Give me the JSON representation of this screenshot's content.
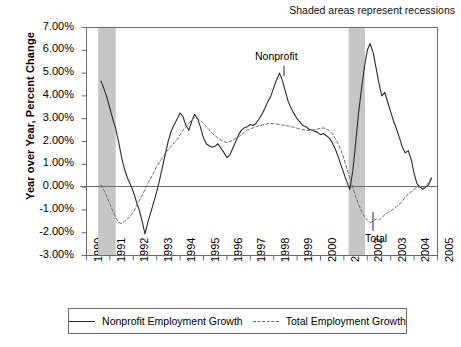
{
  "subtitle": "Shaded areas represent recessions",
  "axis": {
    "ylabel": "Year over Year, Percent Change",
    "yticks": [
      "7.00%",
      "6.00%",
      "5.00%",
      "4.00%",
      "3.00%",
      "2.00%",
      "1.00%",
      "0.00%",
      "-1.00%",
      "-2.00%",
      "-3.00%"
    ],
    "xticks": [
      "1990",
      "1991",
      "1992",
      "1993",
      "1994",
      "1995",
      "1996",
      "1997",
      "1998",
      "1999",
      "2000",
      "2001",
      "2002",
      "2003",
      "2004",
      "2005"
    ]
  },
  "annotations": {
    "nonprofit": "Nonprofit",
    "total": "Total"
  },
  "legend": {
    "items": [
      {
        "label": "Nonprofit Employment Growth",
        "style": "solid",
        "color": "#2b2b2b"
      },
      {
        "label": "Total Employment Growth",
        "style": "dashed",
        "color": "#6e6e6e"
      }
    ]
  },
  "colors": {
    "nonprofit_line": "#2b2b2b",
    "total_line": "#6e6e6e",
    "recession_band": "#c6c6c6",
    "axis": "#6b6b6b",
    "frame": "#6b6b6b"
  },
  "chart_data": {
    "type": "line",
    "title": "",
    "subtitle": "Shaded areas represent recessions",
    "xlabel": "",
    "ylabel": "Year over Year, Percent Change",
    "xlim": [
      1990,
      2005
    ],
    "ylim": [
      -0.03,
      0.07
    ],
    "ytick_values": [
      0.07,
      0.06,
      0.05,
      0.04,
      0.03,
      0.02,
      0.01,
      0.0,
      -0.01,
      -0.02,
      -0.03
    ],
    "xtick_values": [
      1990,
      1991,
      1992,
      1993,
      1994,
      1995,
      1996,
      1997,
      1998,
      1999,
      2000,
      2001,
      2002,
      2003,
      2004,
      2005
    ],
    "grid": false,
    "legend_position": "bottom",
    "shaded_regions": [
      {
        "label": "recession",
        "x_start": 1990.5,
        "x_end": 1991.25
      },
      {
        "label": "recession",
        "x_start": 2001.2,
        "x_end": 2001.9
      }
    ],
    "series": [
      {
        "name": "Nonprofit Employment Growth",
        "style": "solid",
        "color": "#2b2b2b",
        "x": [
          1990.62,
          1990.75,
          1990.88,
          1991.0,
          1991.12,
          1991.25,
          1991.38,
          1991.5,
          1991.62,
          1991.75,
          1991.88,
          1992.0,
          1992.12,
          1992.25,
          1992.38,
          1992.5,
          1992.62,
          1992.75,
          1992.88,
          1993.0,
          1993.12,
          1993.25,
          1993.38,
          1993.5,
          1993.62,
          1993.75,
          1993.88,
          1994.0,
          1994.12,
          1994.25,
          1994.38,
          1994.5,
          1994.62,
          1994.75,
          1994.88,
          1995.0,
          1995.12,
          1995.25,
          1995.38,
          1995.5,
          1995.62,
          1995.75,
          1995.88,
          1996.0,
          1996.12,
          1996.25,
          1996.38,
          1996.5,
          1996.62,
          1996.75,
          1996.88,
          1997.0,
          1997.12,
          1997.25,
          1997.38,
          1997.5,
          1997.62,
          1997.75,
          1997.88,
          1998.0,
          1998.12,
          1998.25,
          1998.38,
          1998.5,
          1998.62,
          1998.75,
          1998.88,
          1999.0,
          1999.12,
          1999.25,
          1999.38,
          1999.5,
          1999.62,
          1999.75,
          1999.88,
          2000.0,
          2000.12,
          2000.25,
          2000.38,
          2000.5,
          2000.62,
          2000.75,
          2000.88,
          2001.0,
          2001.12,
          2001.25,
          2001.38,
          2001.5,
          2001.62,
          2001.75,
          2001.88,
          2002.0,
          2002.12,
          2002.25,
          2002.38,
          2002.5,
          2002.62,
          2002.75,
          2002.88,
          2003.0,
          2003.12,
          2003.25,
          2003.38,
          2003.5,
          2003.62,
          2003.75,
          2003.88,
          2004.0,
          2004.12,
          2004.25,
          2004.38,
          2004.5,
          2004.62,
          2004.75
        ],
        "y": [
          0.0465,
          0.043,
          0.039,
          0.0345,
          0.03,
          0.0255,
          0.0195,
          0.013,
          0.008,
          0.004,
          0.001,
          -0.002,
          -0.006,
          -0.01,
          -0.015,
          -0.0205,
          -0.0155,
          -0.011,
          -0.0065,
          -0.002,
          0.003,
          0.009,
          0.015,
          0.0205,
          0.0245,
          0.0275,
          0.03,
          0.0325,
          0.031,
          0.027,
          0.025,
          0.029,
          0.032,
          0.03,
          0.026,
          0.0215,
          0.019,
          0.018,
          0.0175,
          0.018,
          0.019,
          0.017,
          0.015,
          0.013,
          0.014,
          0.017,
          0.02,
          0.023,
          0.025,
          0.026,
          0.0265,
          0.0275,
          0.027,
          0.028,
          0.03,
          0.032,
          0.0345,
          0.0375,
          0.04,
          0.0435,
          0.047,
          0.05,
          0.0465,
          0.042,
          0.0375,
          0.0345,
          0.032,
          0.03,
          0.0285,
          0.027,
          0.0265,
          0.0255,
          0.025,
          0.0245,
          0.024,
          0.023,
          0.0235,
          0.0225,
          0.0215,
          0.0195,
          0.017,
          0.0135,
          0.0095,
          0.006,
          0.0025,
          -0.001,
          0.007,
          0.019,
          0.032,
          0.043,
          0.053,
          0.06,
          0.063,
          0.059,
          0.052,
          0.0455,
          0.04,
          0.0415,
          0.037,
          0.033,
          0.029,
          0.0255,
          0.0215,
          0.0175,
          0.015,
          0.016,
          0.012,
          0.006,
          0.0015,
          0.0,
          -0.001,
          0.0,
          0.001,
          0.004
        ]
      },
      {
        "name": "Total Employment Growth",
        "style": "dashed",
        "color": "#6e6e6e",
        "x": [
          1990.62,
          1990.75,
          1990.88,
          1991.0,
          1991.12,
          1991.25,
          1991.38,
          1991.5,
          1991.62,
          1991.75,
          1991.88,
          1992.0,
          1992.12,
          1992.25,
          1992.38,
          1992.5,
          1992.62,
          1992.75,
          1992.88,
          1993.0,
          1993.12,
          1993.25,
          1993.38,
          1993.5,
          1993.62,
          1993.75,
          1993.88,
          1994.0,
          1994.12,
          1994.25,
          1994.38,
          1994.5,
          1994.62,
          1994.75,
          1994.88,
          1995.0,
          1995.12,
          1995.25,
          1995.38,
          1995.5,
          1995.62,
          1995.75,
          1995.88,
          1996.0,
          1996.12,
          1996.25,
          1996.38,
          1996.5,
          1996.62,
          1996.75,
          1996.88,
          1997.0,
          1997.12,
          1997.25,
          1997.38,
          1997.5,
          1997.62,
          1997.75,
          1997.88,
          1998.0,
          1998.12,
          1998.25,
          1998.38,
          1998.5,
          1998.62,
          1998.75,
          1998.88,
          1999.0,
          1999.12,
          1999.25,
          1999.38,
          1999.5,
          1999.62,
          1999.75,
          1999.88,
          2000.0,
          2000.12,
          2000.25,
          2000.38,
          2000.5,
          2000.62,
          2000.75,
          2000.88,
          2001.0,
          2001.12,
          2001.25,
          2001.38,
          2001.5,
          2001.62,
          2001.75,
          2001.88,
          2002.0,
          2002.12,
          2002.25,
          2002.38,
          2002.5,
          2002.62,
          2002.75,
          2002.88,
          2003.0,
          2003.12,
          2003.25,
          2003.38,
          2003.5,
          2003.62,
          2003.75,
          2003.88,
          2004.0,
          2004.12,
          2004.25,
          2004.38,
          2004.5,
          2004.62,
          2004.75
        ],
        "y": [
          0.001,
          -0.0015,
          -0.0045,
          -0.0075,
          -0.0105,
          -0.0135,
          -0.0155,
          -0.016,
          -0.015,
          -0.014,
          -0.0125,
          -0.011,
          -0.0085,
          -0.006,
          -0.0035,
          -0.001,
          0.0015,
          0.004,
          0.0065,
          0.009,
          0.011,
          0.013,
          0.015,
          0.0165,
          0.018,
          0.0195,
          0.021,
          0.023,
          0.025,
          0.0265,
          0.028,
          0.0295,
          0.0305,
          0.03,
          0.029,
          0.028,
          0.0265,
          0.025,
          0.0235,
          0.0225,
          0.0215,
          0.0205,
          0.02,
          0.0195,
          0.02,
          0.0205,
          0.0215,
          0.022,
          0.023,
          0.024,
          0.025,
          0.0255,
          0.026,
          0.0265,
          0.027,
          0.0272,
          0.0275,
          0.0278,
          0.028,
          0.0278,
          0.0276,
          0.0274,
          0.0272,
          0.027,
          0.0268,
          0.0265,
          0.0262,
          0.0258,
          0.0255,
          0.0252,
          0.025,
          0.0248,
          0.025,
          0.0252,
          0.0255,
          0.0258,
          0.026,
          0.0255,
          0.0248,
          0.0235,
          0.0215,
          0.019,
          0.016,
          0.0125,
          0.0085,
          0.004,
          0.0,
          -0.004,
          -0.0075,
          -0.0105,
          -0.013,
          -0.0145,
          -0.0155,
          -0.015,
          -0.014,
          -0.0145,
          -0.0135,
          -0.012,
          -0.011,
          -0.0105,
          -0.0095,
          -0.0085,
          -0.0075,
          -0.006,
          -0.0045,
          -0.003,
          -0.002,
          -0.001,
          0.0,
          0.0,
          -0.0005,
          0.0005,
          0.002,
          0.0045
        ]
      }
    ]
  }
}
